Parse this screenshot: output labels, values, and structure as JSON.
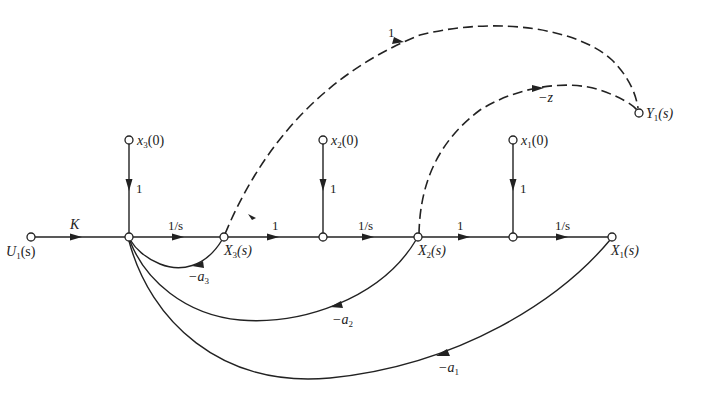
{
  "diagram": {
    "type": "signal-flow-graph",
    "nodes": {
      "u1": {
        "label": "U",
        "sub": "1",
        "arg": "(s)"
      },
      "x3": {
        "label": "X",
        "sub": "3",
        "arg": "(s)"
      },
      "x2": {
        "label": "X",
        "sub": "2",
        "arg": "(s)"
      },
      "x1": {
        "label": "X",
        "sub": "1",
        "arg": "(s)"
      },
      "y1": {
        "label": "Y",
        "sub": "1",
        "arg": "(s)"
      },
      "x3_0": {
        "label": "x",
        "sub": "3",
        "arg": "(0)"
      },
      "x2_0": {
        "label": "x",
        "sub": "2",
        "arg": "(0)"
      },
      "x1_0": {
        "label": "x",
        "sub": "1",
        "arg": "(0)"
      }
    },
    "gains": {
      "k": "K",
      "int3": "1/s",
      "int2": "1/s",
      "int1": "1/s",
      "x3_to_n2": "1",
      "x2_to_n3": "1",
      "ic3": "1",
      "ic2": "1",
      "ic1": "1",
      "x3_to_y1": "1",
      "x2_to_y1": "−z",
      "fb_a3": "−a",
      "fb_a3_sub": "3",
      "fb_a2": "−a",
      "fb_a2_sub": "2",
      "fb_a1": "−a",
      "fb_a1_sub": "1"
    }
  }
}
